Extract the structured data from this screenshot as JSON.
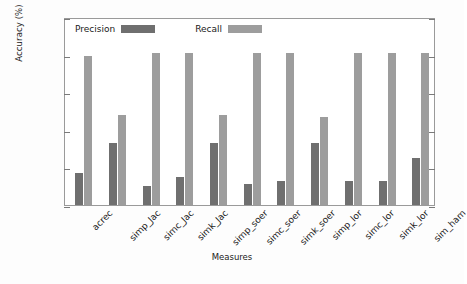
{
  "chart_data": {
    "type": "bar",
    "title": "",
    "xlabel": "Measures",
    "ylabel": "Accuracy (%)",
    "ylim": [
      0,
      1
    ],
    "yticks": [
      "0",
      "0.2",
      "0.4",
      "0.6",
      "0.8",
      "1"
    ],
    "ytick_values": [
      0,
      0.2,
      0.4,
      0.6,
      0.8,
      1
    ],
    "grid": false,
    "legend_position": "top-left-inside",
    "categories": [
      "acrec",
      "simp_Jac",
      "simc_Jac",
      "simk_Jac",
      "simp_soer",
      "simc_soer",
      "simk_soer",
      "simp_lor",
      "simc_lor",
      "simk_lor",
      "sim_ham"
    ],
    "series": [
      {
        "name": "Precision",
        "color": "#6f6f6f",
        "values": [
          0.17,
          0.33,
          0.1,
          0.15,
          0.33,
          0.11,
          0.13,
          0.33,
          0.13,
          0.13,
          0.25
        ]
      },
      {
        "name": "Recall",
        "color": "#9d9d9d",
        "values": [
          0.795,
          0.48,
          0.81,
          0.81,
          0.48,
          0.81,
          0.81,
          0.47,
          0.81,
          0.81,
          0.81
        ]
      }
    ]
  },
  "legend": {
    "items": [
      {
        "label": "Precision",
        "color": "#6f6f6f"
      },
      {
        "label": "Recall",
        "color": "#9d9d9d"
      }
    ]
  },
  "axes": {
    "y_title": "Accuracy (%)",
    "x_title": "Measures"
  }
}
